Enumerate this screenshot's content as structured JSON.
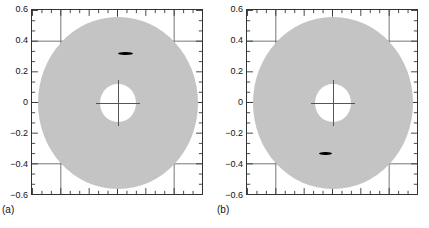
{
  "figure": {
    "type": "two-panel-scatter-on-annulus",
    "background_color": "#ffffff",
    "disc_color": "#c4c4c4",
    "marker_color": "#000000",
    "axis_color": "#333333",
    "grid_color": "#555555"
  },
  "panels": [
    {
      "id": "a",
      "caption": "(a)",
      "chart_data": {
        "type": "scatter",
        "title": "",
        "xlabel": "",
        "ylabel": "",
        "xlim": [
          -0.6,
          0.6
        ],
        "ylim": [
          -0.6,
          0.6
        ],
        "grid": true,
        "grid_x": [
          -0.4,
          0.0,
          0.4
        ],
        "grid_y": [
          -0.4,
          0.0,
          0.4
        ],
        "xticks_major": [
          -0.6,
          -0.4,
          -0.2,
          0,
          0.2,
          0.4,
          0.6
        ],
        "xtick_labels": [
          "",
          "",
          "",
          "",
          "",
          "",
          ""
        ],
        "yticks_major": [
          -0.6,
          -0.4,
          -0.2,
          0,
          0.2,
          0.4,
          0.6
        ],
        "ytick_labels": [
          "-0.6",
          "-0.4",
          "-0.2",
          "0",
          "0.2",
          "0.4",
          "0.6"
        ],
        "minor_ticks_per_major": 2,
        "annulus": {
          "center": [
            0.0,
            0.0
          ],
          "outer_radius": 0.555,
          "inner_radius": 0.125,
          "fill": "#c4c4c4"
        },
        "markers": [
          {
            "label": "spot",
            "x": 0.05,
            "y": 0.32,
            "width": 0.105,
            "height": 0.022,
            "color": "#000000"
          }
        ]
      }
    },
    {
      "id": "b",
      "caption": "(b)",
      "chart_data": {
        "type": "scatter",
        "title": "",
        "xlabel": "",
        "ylabel": "",
        "xlim": [
          -0.6,
          0.6
        ],
        "ylim": [
          -0.6,
          0.6
        ],
        "grid": true,
        "grid_x": [
          -0.4,
          0.0,
          0.4
        ],
        "grid_y": [
          -0.4,
          0.0,
          0.4
        ],
        "xticks_major": [
          -0.6,
          -0.4,
          -0.2,
          0,
          0.2,
          0.4,
          0.6
        ],
        "xtick_labels": [
          "",
          "",
          "",
          "",
          "",
          "",
          ""
        ],
        "yticks_major": [
          -0.6,
          -0.4,
          -0.2,
          0,
          0.2,
          0.4,
          0.6
        ],
        "ytick_labels": [
          "-0.6",
          "-0.4",
          "-0.2",
          "0",
          "0.2",
          "0.4",
          "0.6"
        ],
        "minor_ticks_per_major": 2,
        "annulus": {
          "center": [
            0.0,
            0.0
          ],
          "outer_radius": 0.555,
          "inner_radius": 0.125,
          "fill": "#c4c4c4"
        },
        "markers": [
          {
            "label": "spot",
            "x": -0.05,
            "y": -0.325,
            "width": 0.09,
            "height": 0.022,
            "color": "#000000"
          }
        ]
      }
    }
  ]
}
